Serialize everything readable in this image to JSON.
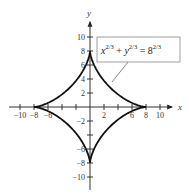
{
  "chart_data": {
    "type": "line",
    "title": "",
    "xlabel": "x",
    "ylabel": "y",
    "xlim": [
      -11,
      11
    ],
    "ylim": [
      -11,
      11
    ],
    "grid": false,
    "x_ticks": [
      -10,
      -8,
      -6,
      -4,
      -2,
      2,
      4,
      6,
      8,
      10
    ],
    "y_ticks": [
      -10,
      -8,
      -6,
      -4,
      -2,
      2,
      4,
      6,
      8,
      10
    ],
    "x_tick_labels": [
      {
        "value": -10,
        "label": "−10"
      },
      {
        "value": -8,
        "label": "−8"
      },
      {
        "value": -6,
        "label": "−6"
      },
      {
        "value": 2,
        "label": "2"
      },
      {
        "value": 6,
        "label": "6"
      },
      {
        "value": 8,
        "label": "8"
      },
      {
        "value": 10,
        "label": "10"
      }
    ],
    "y_tick_labels": [
      {
        "value": 10,
        "label": "10"
      },
      {
        "value": 8,
        "label": "8"
      },
      {
        "value": 6,
        "label": "6"
      },
      {
        "value": 4,
        "label": "4"
      },
      {
        "value": 2,
        "label": "2"
      },
      {
        "value": -2,
        "label": "−2"
      },
      {
        "value": -6,
        "label": "−6"
      },
      {
        "value": -8,
        "label": "−8"
      },
      {
        "value": -10,
        "label": "−10"
      }
    ],
    "series": [
      {
        "name": "astroid",
        "equation": "x^(2/3) + y^(2/3) = 8^(2/3)",
        "parametric": "x = 8cos^3(t), y = 8sin^3(t)",
        "radius": 8,
        "cusps": [
          [
            8,
            0
          ],
          [
            0,
            8
          ],
          [
            -8,
            0
          ],
          [
            0,
            -8
          ]
        ]
      }
    ],
    "annotations": [
      {
        "text": "x^{2/3} + y^{2/3} = 8^{2/3}",
        "points_to": [
          3,
          3.5
        ]
      }
    ]
  },
  "labels": {
    "x_axis": "x",
    "y_axis": "y",
    "eq_x": "x",
    "eq_y": "y",
    "eq_base": "8",
    "eq_exp": "2/3",
    "eq_plus": " + ",
    "eq_equals": " = "
  }
}
